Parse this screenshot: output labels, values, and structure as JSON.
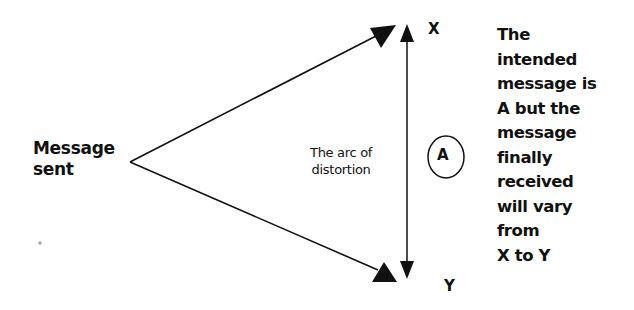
{
  "diagram": {
    "source_label": [
      "Message",
      "sent"
    ],
    "arc_label": [
      "The arc of",
      "distortion"
    ],
    "intended_label": "A",
    "upper_bound_label": "X",
    "lower_bound_label": "Y",
    "explanation": [
      "The",
      "intended",
      "message is",
      "A but the",
      "message",
      "finally",
      "received",
      "will vary",
      "from",
      "X to Y"
    ],
    "colors": {
      "ink": "#111111",
      "background": "#ffffff"
    }
  }
}
